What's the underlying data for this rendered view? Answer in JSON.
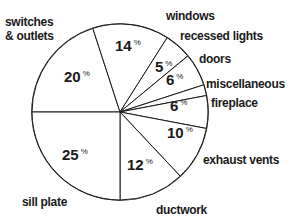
{
  "chart_data": {
    "type": "pie",
    "title": "",
    "start": "left",
    "direction": "clockwise",
    "slices": [
      {
        "label": "switches & outlets",
        "label_lines": [
          "switches",
          "& outlets"
        ],
        "value": 20,
        "value_label": "20"
      },
      {
        "label": "windows",
        "label_lines": [
          "windows"
        ],
        "value": 14,
        "value_label": "14"
      },
      {
        "label": "recessed lights",
        "label_lines": [
          "recessed lights"
        ],
        "value": 5,
        "value_label": "5"
      },
      {
        "label": "doors",
        "label_lines": [
          "doors"
        ],
        "value": 6,
        "value_label": "6"
      },
      {
        "label": "miscellaneous",
        "label_lines": [
          "miscellaneous"
        ],
        "value": 2,
        "value_label": ""
      },
      {
        "label": "fireplace",
        "label_lines": [
          "fireplace"
        ],
        "value": 6,
        "value_label": "6"
      },
      {
        "label": "exhaust vents",
        "label_lines": [
          "exhaust vents"
        ],
        "value": 10,
        "value_label": "10"
      },
      {
        "label": "ductwork",
        "label_lines": [
          "ductwork"
        ],
        "value": 12,
        "value_label": "12"
      },
      {
        "label": "sill plate",
        "label_lines": [
          "sill plate"
        ],
        "value": 25,
        "value_label": "25"
      }
    ],
    "percent_symbol": "%"
  }
}
